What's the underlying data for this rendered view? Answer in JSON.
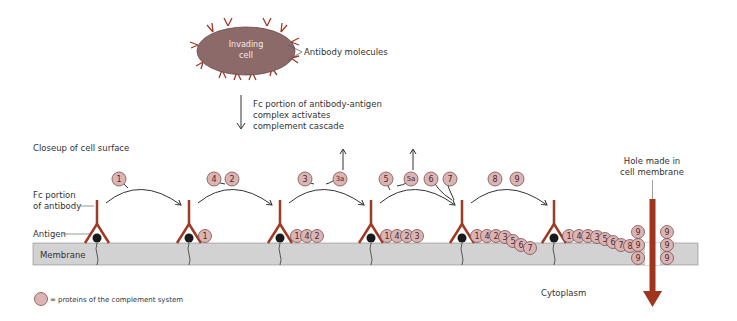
{
  "invading_cell": {
    "label_line1": "Invading",
    "label_line2": "cell",
    "antibody_label": "Antibody molecules",
    "fill": "#8c6a6a",
    "antibody_color": "#a03a24"
  },
  "cascade_note": {
    "line1": "Fc portion of antibody-antigen",
    "line2": "complex activates",
    "line3": "complement cascade"
  },
  "closeup_label": "Closeup of cell surface",
  "labels": {
    "fc_line1": "Fc portion",
    "fc_line2": "of antibody",
    "antigen": "Antigen",
    "membrane": "Membrane",
    "cytoplasm": "Cytoplasm",
    "hole_line1": "Hole made in",
    "hole_line2": "cell membrane"
  },
  "legend": {
    "text": "= proteins of the complement system"
  },
  "colors": {
    "membrane": "#d2d2d2",
    "protein": "#dcb4b4",
    "antibody": "#a03a24",
    "hole_arrow": "#a0341f"
  },
  "steps": [
    {
      "incoming": [
        "1"
      ],
      "released": [],
      "bound": []
    },
    {
      "incoming": [
        "4",
        "2"
      ],
      "released": [],
      "bound": [
        "1"
      ]
    },
    {
      "incoming": [
        "3"
      ],
      "released": [
        "3a"
      ],
      "bound": [
        "1",
        "4",
        "2"
      ]
    },
    {
      "incoming": [
        "5",
        "6",
        "7"
      ],
      "released": [
        "5a"
      ],
      "bound": [
        "1",
        "4",
        "2",
        "3"
      ]
    },
    {
      "incoming": [
        "8",
        "9"
      ],
      "released": [],
      "bound": [
        "1",
        "4",
        "2",
        "3",
        "5",
        "6",
        "7"
      ]
    },
    {
      "incoming": [],
      "released": [],
      "bound": [
        "1",
        "4",
        "2",
        "3",
        "5",
        "6",
        "7",
        "8"
      ]
    }
  ],
  "proteins": {
    "p1": "1",
    "p2": "2",
    "p3": "3",
    "p3a": "3a",
    "p4": "4",
    "p5": "5",
    "p5a": "5a",
    "p6": "6",
    "p7": "7",
    "p8": "8",
    "p9": "9"
  }
}
